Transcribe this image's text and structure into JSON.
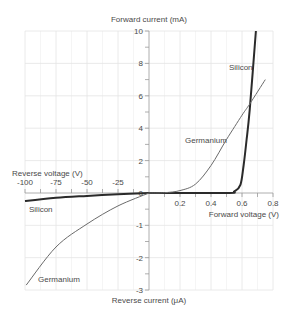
{
  "chart_data": {
    "type": "line",
    "title": "",
    "axes": {
      "y_top_label": "Forward current (mA)",
      "y_bottom_label": "Reverse current (μA)",
      "x_right_label": "Forward voltage (V)",
      "x_left_label": "Reverse voltage (V)"
    },
    "x_ticks_forward": [
      "0.2",
      "0.4",
      "0.6",
      "0.8"
    ],
    "x_ticks_reverse": [
      "-100",
      "-75",
      "-50",
      "-25",
      "0"
    ],
    "y_ticks_forward": [
      "10",
      "8",
      "6",
      "4",
      "2",
      "0"
    ],
    "y_ticks_reverse": [
      "-1",
      "-2",
      "-3"
    ],
    "xlim_forward": [
      0,
      0.8
    ],
    "xlim_reverse": [
      -100,
      0
    ],
    "ylim_forward": [
      0,
      10
    ],
    "ylim_reverse": [
      -3,
      0
    ],
    "grid": true,
    "series": [
      {
        "name": "Silicon",
        "color": "#2a2a2a",
        "forward": {
          "x": [
            0,
            0.5,
            0.55,
            0.59,
            0.61,
            0.63,
            0.65,
            0.69
          ],
          "y": [
            0,
            0,
            0.1,
            0.5,
            1.7,
            3.3,
            5.2,
            10
          ]
        },
        "reverse": {
          "x": [
            -100,
            -75,
            -50,
            -25,
            0
          ],
          "y": [
            -0.25,
            -0.15,
            -0.09,
            -0.04,
            0
          ]
        }
      },
      {
        "name": "Germanium",
        "color": "#6a6a6a",
        "forward": {
          "x": [
            0,
            0.1,
            0.2,
            0.3,
            0.4,
            0.5,
            0.6,
            0.65,
            0.75
          ],
          "y": [
            0,
            0.02,
            0.15,
            0.55,
            1.7,
            3.3,
            4.8,
            5.5,
            7
          ]
        },
        "reverse": {
          "x": [
            -99,
            -75,
            -50,
            -25,
            0
          ],
          "y": [
            -2.85,
            -1.67,
            -0.96,
            -0.4,
            0
          ]
        }
      }
    ],
    "annotations": [
      {
        "text": "Silicon",
        "near": "forward, top right"
      },
      {
        "text": "Germanium",
        "near": "forward, middle"
      },
      {
        "text": "Silicon",
        "near": "reverse, left"
      },
      {
        "text": "Germanium",
        "near": "reverse, bottom left"
      }
    ]
  },
  "labels": {
    "y_top": "Forward current (mA)",
    "y_bottom": "Reverse current (μA)",
    "x_right": "Forward voltage (V)",
    "x_left": "Reverse voltage (V)",
    "silicon_fwd": "Silicon",
    "germanium_fwd": "Germanium",
    "silicon_rev": "Silicon",
    "germanium_rev": "Germanium"
  }
}
